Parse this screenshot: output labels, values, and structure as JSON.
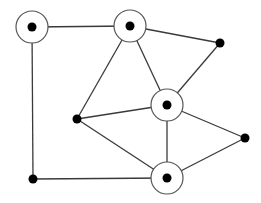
{
  "diagram": {
    "type": "graph",
    "width": 261,
    "height": 203,
    "colors": {
      "background": "#ffffff",
      "edge": "#3a3a3a",
      "ring_stroke": "#555555",
      "ring_fill": "#ffffff",
      "dot": "#000000"
    },
    "nodes": [
      {
        "id": "A",
        "x": 32,
        "y": 27,
        "ringed": true
      },
      {
        "id": "B",
        "x": 130,
        "y": 26,
        "ringed": true
      },
      {
        "id": "C",
        "x": 167,
        "y": 105,
        "ringed": true
      },
      {
        "id": "D",
        "x": 167,
        "y": 178,
        "ringed": true
      },
      {
        "id": "E",
        "x": 220,
        "y": 43,
        "ringed": false
      },
      {
        "id": "F",
        "x": 77,
        "y": 119,
        "ringed": false
      },
      {
        "id": "G",
        "x": 245,
        "y": 138,
        "ringed": false
      },
      {
        "id": "H",
        "x": 33,
        "y": 179,
        "ringed": false
      }
    ],
    "edges": [
      [
        "A",
        "B"
      ],
      [
        "A",
        "H"
      ],
      [
        "H",
        "D"
      ],
      [
        "B",
        "E"
      ],
      [
        "B",
        "C"
      ],
      [
        "B",
        "F"
      ],
      [
        "E",
        "C"
      ],
      [
        "F",
        "C"
      ],
      [
        "F",
        "D"
      ],
      [
        "C",
        "D"
      ],
      [
        "C",
        "G"
      ],
      [
        "D",
        "G"
      ]
    ],
    "ring_radius": 16,
    "dot_radius_ringed": 4.5,
    "dot_radius_plain": 4.5
  }
}
